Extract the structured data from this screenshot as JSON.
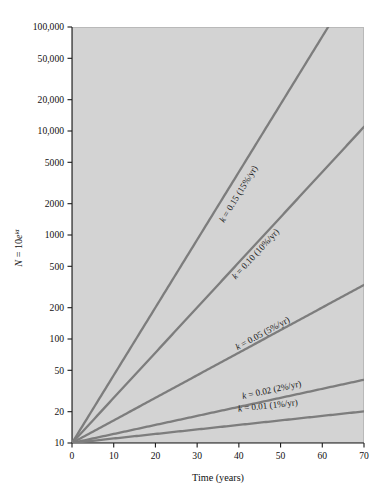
{
  "figure": {
    "background_color": "#ffffff",
    "plot_background_color": "#d3d3d3",
    "line_color": "#7d7d7d",
    "axis_color": "#1a1a1a"
  },
  "axes": {
    "x_title": "Time (years)",
    "y_title_parts": {
      "n": "N",
      "equals": " = 10",
      "base": "e",
      "exponent": "kt"
    },
    "y_title_plain": "N = 10e^kt",
    "x_ticks": [
      "0",
      "10",
      "20",
      "30",
      "40",
      "50",
      "60",
      "70"
    ],
    "x_tick_values": [
      0,
      10,
      20,
      30,
      40,
      50,
      60,
      70
    ],
    "y_ticks": [
      "10",
      "20",
      "50",
      "100",
      "200",
      "500",
      "1000",
      "2000",
      "5000",
      "10,000",
      "20,000",
      "50,000",
      "100,000"
    ],
    "y_tick_values": [
      10,
      20,
      50,
      100,
      200,
      500,
      1000,
      2000,
      5000,
      10000,
      20000,
      50000,
      100000
    ]
  },
  "chart_data": {
    "type": "line",
    "title": "",
    "subtitle": "",
    "xlabel": "Time (years)",
    "ylabel": "N = 10e^kt",
    "xlim": [
      0,
      70
    ],
    "ylim": [
      10,
      100000
    ],
    "yscale": "log",
    "xscale": "linear",
    "grid": false,
    "legend": "inline-curve-labels",
    "initial_value_N0": 10,
    "equation": "N = 10e^(kt)",
    "x": [
      0,
      10,
      20,
      30,
      40,
      50,
      60,
      70
    ],
    "series": [
      {
        "name": "k = 0.15 (15%/yr)",
        "k": 0.15,
        "percent_per_year": 15,
        "label": "k = 0.15 (15%/yr)",
        "label_x_year": 40.5,
        "label_y_value": 2400,
        "values": [
          10,
          44.8,
          200.9,
          900.2,
          4034.3,
          18080,
          81031,
          363155
        ],
        "clipped_at_top": true,
        "exit_x_year": 61.4
      },
      {
        "name": "k = 0.10 (10%/yr)",
        "k": 0.1,
        "percent_per_year": 10,
        "label": "k = 0.10 (10%/yr)",
        "label_x_year": 44.5,
        "label_y_value": 630,
        "values": [
          10,
          27.2,
          73.9,
          200.9,
          545.0,
          1484.1,
          4034.3,
          10966
        ],
        "clipped_at_top": false,
        "end_value": 10966
      },
      {
        "name": "k = 0.05 (5%/yr)",
        "k": 0.05,
        "percent_per_year": 5,
        "label": "k = 0.05 (5%/yr)",
        "label_x_year": 46,
        "label_y_value": 107,
        "values": [
          10,
          16.5,
          27.2,
          44.8,
          73.9,
          121.8,
          200.9,
          331.2
        ],
        "clipped_at_top": false,
        "end_value": 331.2
      },
      {
        "name": "k = 0.02 (2%/yr)",
        "k": 0.02,
        "percent_per_year": 2,
        "label": "k = 0.02 (2%/yr)",
        "label_x_year": 48,
        "label_y_value": 30.5,
        "values": [
          10,
          12.2,
          14.9,
          18.2,
          22.3,
          27.2,
          33.2,
          40.6
        ],
        "clipped_at_top": false,
        "end_value": 40.6
      },
      {
        "name": "k = 0.01 (1%/yr)",
        "k": 0.01,
        "percent_per_year": 1,
        "label": "k = 0.01 (1%/yr)",
        "label_x_year": 47,
        "label_y_value": 21.5,
        "values": [
          10,
          11.05,
          12.2,
          13.5,
          14.9,
          16.5,
          18.2,
          20.1
        ],
        "clipped_at_top": false,
        "end_value": 20.1
      }
    ]
  }
}
